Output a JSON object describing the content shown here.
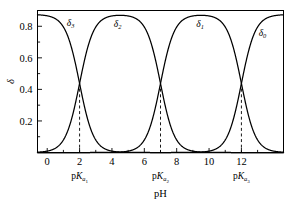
{
  "chart_data": {
    "type": "line",
    "title": "",
    "subtitle": "",
    "xlabel": "pH",
    "ylabel": "δ",
    "xlim": [
      -0.6,
      14.6
    ],
    "ylim": [
      0.0,
      0.9
    ],
    "grid": false,
    "legend_position": "inline-annotations",
    "x_ticks": [
      0,
      2,
      4,
      6,
      8,
      10,
      12
    ],
    "x_tick_labels": [
      "0",
      "2",
      "4",
      "6",
      "8",
      "10",
      "12"
    ],
    "x_minor_ticks": [
      1,
      3,
      5,
      7,
      9,
      11,
      13
    ],
    "y_ticks": [
      0.2,
      0.4,
      0.6,
      0.8
    ],
    "y_tick_labels": [
      "0.2",
      "0.4",
      "0.6",
      "0.8"
    ],
    "y_minor_ticks": [
      0.1,
      0.3,
      0.5,
      0.7
    ],
    "pka_values": [
      2.0,
      7.0,
      12.0
    ],
    "crossing_delta": 0.44,
    "plateau_delta": 0.875,
    "series": [
      {
        "name": "δ₃",
        "subscript": "3",
        "label_x": 1.45,
        "label_y": 0.8,
        "protonation": 3
      },
      {
        "name": "δ₂",
        "subscript": "2",
        "label_x": 4.35,
        "label_y": 0.795,
        "protonation": 2
      },
      {
        "name": "δ₁",
        "subscript": "1",
        "label_x": 9.45,
        "label_y": 0.795,
        "protonation": 1
      },
      {
        "name": "δ₀",
        "subscript": "0",
        "label_x": 13.3,
        "label_y": 0.74,
        "protonation": 0
      }
    ],
    "annotations": [
      {
        "name": "pKa1",
        "text_main": "p",
        "text_italic": "K",
        "text_sub": "a",
        "text_subsub": "1",
        "x": 2.0
      },
      {
        "name": "pKa2",
        "text_main": "p",
        "text_italic": "K",
        "text_sub": "a",
        "text_subsub": "2",
        "x": 7.0
      },
      {
        "name": "pKa3",
        "text_main": "p",
        "text_italic": "K",
        "text_sub": "a",
        "text_subsub": "3",
        "x": 12.0
      }
    ]
  },
  "axes": {
    "x_title": "pH",
    "y_title": "δ"
  },
  "colors": {
    "background": "#ffffff",
    "foreground": "#000000",
    "curve": "#000000",
    "dashed": "#000000"
  }
}
